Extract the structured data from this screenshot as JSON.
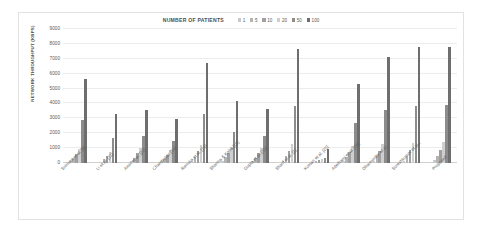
{
  "chart_data": {
    "type": "bar",
    "title": "NUMBER OF PATIENTS",
    "xlabel": "",
    "ylabel": "NETWORK THROUGHPUT (KBPS)",
    "ylim": [
      0,
      9000
    ],
    "yticks": [
      0,
      1000,
      2000,
      3000,
      4000,
      5000,
      6000,
      7000,
      8000,
      9000
    ],
    "grid": true,
    "legend_position": "top-center",
    "categories": [
      "Srinivas et al. [8]",
      "Li et al. [11]",
      "Amin et al. [22]",
      "Chandrakar [14]",
      "Renuka et al. [16]",
      "Sharma & Kalra [16]",
      "Gupta et al. [19]",
      "Sharif et al. [1]",
      "Kumari et al. [25]",
      "Adelhami et al. [26]",
      "Dharminder et al...",
      "Sureshkumar et al...",
      "Proposed"
    ],
    "series": [
      {
        "name": "1",
        "color": "#c9c9c9",
        "values": [
          120,
          95,
          130,
          110,
          150,
          135,
          125,
          160,
          60,
          140,
          155,
          165,
          170
        ]
      },
      {
        "name": "5",
        "color": "#b4b4b4",
        "values": [
          330,
          260,
          360,
          300,
          420,
          380,
          350,
          450,
          110,
          400,
          440,
          470,
          480
        ]
      },
      {
        "name": "10",
        "color": "#a0a0a0",
        "values": [
          620,
          480,
          660,
          560,
          780,
          700,
          650,
          840,
          180,
          740,
          820,
          870,
          890
        ]
      },
      {
        "name": "20",
        "color": "#cfcfcf",
        "values": [
          960,
          720,
          1020,
          860,
          1200,
          1080,
          1000,
          1300,
          260,
          1140,
          1260,
          1340,
          1380
        ]
      },
      {
        "name": "50",
        "color": "#8c8c8c",
        "values": [
          2880,
          1680,
          1820,
          1500,
          3320,
          2100,
          1840,
          3800,
          330,
          2660,
          3560,
          3840,
          3880
        ]
      },
      {
        "name": "100",
        "color": "#6e6e6e",
        "values": [
          5620,
          3300,
          3540,
          2940,
          6720,
          4140,
          3620,
          7640,
          930,
          5280,
          7140,
          7760,
          7820
        ]
      }
    ]
  }
}
